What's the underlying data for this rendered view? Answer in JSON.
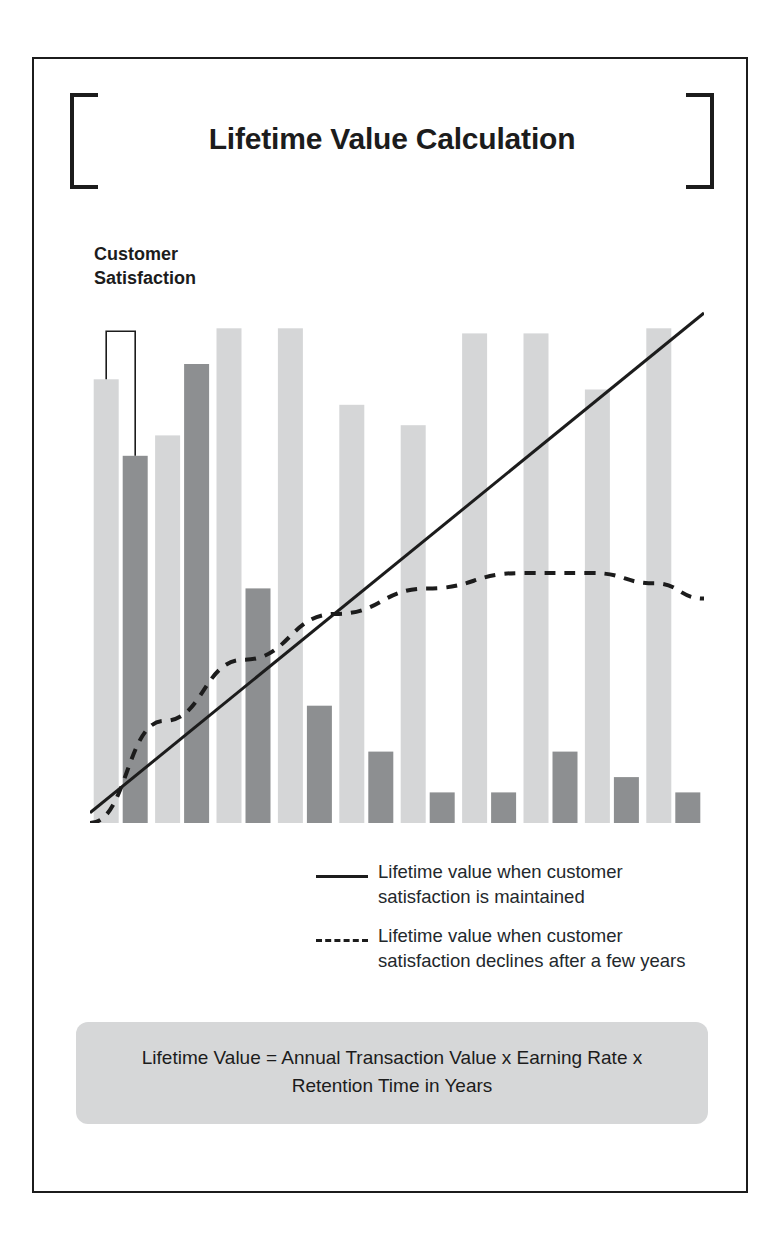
{
  "page": {
    "title": "Lifetime Value Calculation",
    "frame_color": "#1c1c1c",
    "background": "#ffffff"
  },
  "annotation": {
    "customer_satisfaction_label": "Customer\nSatisfaction",
    "bracket_icon": "satisfaction-bracket"
  },
  "legend": {
    "items": [
      {
        "style": "solid",
        "label": "Lifetime value when customer satisfaction is maintained"
      },
      {
        "style": "dashed",
        "label": "Lifetime value when customer satisfaction declines after a few years"
      }
    ]
  },
  "formula": {
    "text": "Lifetime Value = Annual Transaction Value x Earning Rate x Retention Time in Years"
  },
  "chart_data": {
    "type": "bar",
    "title": "Lifetime Value Calculation",
    "xlabel": "",
    "ylabel": "",
    "ylim": [
      0,
      100
    ],
    "grid": false,
    "legend_position": "below",
    "colors": {
      "light_bar": "#d5d6d7",
      "dark_bar": "#8d8f91",
      "line": "#1c1c1c"
    },
    "categories": [
      "1",
      "2",
      "3",
      "4",
      "5",
      "6",
      "7",
      "8",
      "9",
      "10"
    ],
    "series": [
      {
        "name": "Annual transaction value",
        "color": "#d5d6d7",
        "values": [
          87,
          76,
          97,
          97,
          82,
          78,
          96,
          96,
          85,
          97
        ]
      },
      {
        "name": "Customer satisfaction",
        "color": "#8d8f91",
        "values": [
          72,
          90,
          46,
          23,
          14,
          6,
          6,
          14,
          9,
          6
        ]
      }
    ],
    "overlays": [
      {
        "name": "Lifetime value when customer satisfaction is maintained",
        "type": "line",
        "style": "solid",
        "x": [
          0,
          100
        ],
        "y": [
          2,
          100
        ]
      },
      {
        "name": "Lifetime value when customer satisfaction declines after a few years",
        "type": "line",
        "style": "dashed",
        "x": [
          0,
          12,
          25,
          40,
          55,
          70,
          82,
          92,
          100
        ],
        "y": [
          0,
          20,
          32,
          41,
          46,
          49,
          49,
          47,
          44
        ]
      }
    ]
  }
}
